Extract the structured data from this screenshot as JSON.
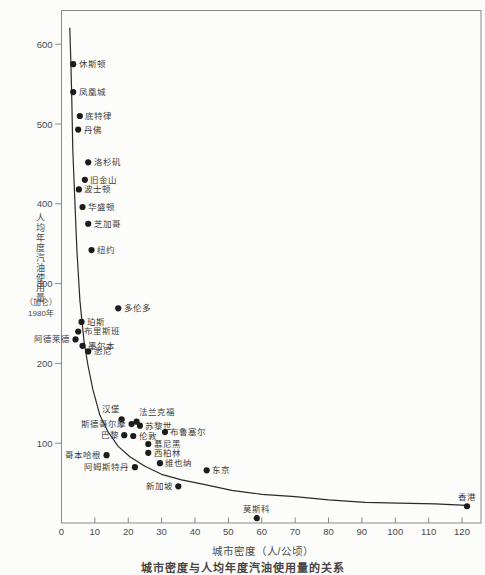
{
  "page": {
    "background": "#fcfcfa",
    "caption": "城市密度与人均年度汽油使用量的关系"
  },
  "chart_data": {
    "type": "scatter",
    "title": "",
    "xlabel": "城市密度（人/公顷）",
    "ylabel": "人均年度汽油使用量",
    "ylabel_unit": "（加仑）",
    "ylabel_year": "1980年",
    "xlim": [
      0,
      125
    ],
    "ylim": [
      0,
      640
    ],
    "x_ticks": [
      0,
      10,
      20,
      30,
      40,
      50,
      60,
      70,
      80,
      90,
      100,
      110,
      120
    ],
    "y_ticks": [
      100,
      200,
      300,
      400,
      500,
      600
    ],
    "grid": false,
    "legend": "none",
    "colors": {
      "dot": "#1c1c1c",
      "curve": "#2a2a2a",
      "frame": "#8a8a8a",
      "text": "#3d3d3d"
    },
    "points": [
      {
        "name": "休斯顿",
        "x": 3.5,
        "y": 575,
        "side": "right"
      },
      {
        "name": "凤凰城",
        "x": 3.5,
        "y": 540,
        "side": "right"
      },
      {
        "name": "底特律",
        "x": 5.5,
        "y": 510,
        "side": "right"
      },
      {
        "name": "丹佛",
        "x": 5,
        "y": 493,
        "side": "right"
      },
      {
        "name": "洛杉矶",
        "x": 8,
        "y": 452,
        "side": "right"
      },
      {
        "name": "旧金山",
        "x": 7,
        "y": 430,
        "side": "right"
      },
      {
        "name": "波士顿",
        "x": 5.2,
        "y": 418,
        "side": "right"
      },
      {
        "name": "华盛顿",
        "x": 6.3,
        "y": 396,
        "side": "right"
      },
      {
        "name": "芝加哥",
        "x": 8,
        "y": 375,
        "side": "right"
      },
      {
        "name": "纽约",
        "x": 9,
        "y": 342,
        "side": "right"
      },
      {
        "name": "多伦多",
        "x": 17,
        "y": 269,
        "side": "right"
      },
      {
        "name": "珀斯",
        "x": 6,
        "y": 252,
        "side": "right"
      },
      {
        "name": "布里斯班",
        "x": 5,
        "y": 240,
        "side": "right"
      },
      {
        "name": "阿德莱德",
        "x": 4.2,
        "y": 230,
        "side": "left"
      },
      {
        "name": "墨尔本",
        "x": 6.3,
        "y": 222,
        "side": "right"
      },
      {
        "name": "悉尼",
        "x": 8,
        "y": 215,
        "side": "right"
      },
      {
        "name": "汉堡",
        "x": 18,
        "y": 130,
        "side": "above-left"
      },
      {
        "name": "法兰克福",
        "x": 22.5,
        "y": 127,
        "side": "above-right"
      },
      {
        "name": "斯德哥尔摩",
        "x": 21,
        "y": 124,
        "side": "left"
      },
      {
        "name": "苏黎世",
        "x": 23.5,
        "y": 122,
        "side": "right"
      },
      {
        "name": "布鲁塞尔",
        "x": 31,
        "y": 114,
        "side": "right"
      },
      {
        "name": "巴黎",
        "x": 18.8,
        "y": 110,
        "side": "left"
      },
      {
        "name": "伦敦",
        "x": 21.5,
        "y": 109,
        "side": "right"
      },
      {
        "name": "慕尼黑",
        "x": 26,
        "y": 99,
        "side": "right"
      },
      {
        "name": "西柏林",
        "x": 26,
        "y": 88,
        "side": "right"
      },
      {
        "name": "哥本哈根",
        "x": 13.5,
        "y": 85,
        "side": "left"
      },
      {
        "name": "维也纳",
        "x": 29.5,
        "y": 75,
        "side": "right"
      },
      {
        "name": "阿姆斯特丹",
        "x": 22,
        "y": 70,
        "side": "left"
      },
      {
        "name": "东京",
        "x": 43.5,
        "y": 66,
        "side": "right"
      },
      {
        "name": "新加坡",
        "x": 35,
        "y": 46,
        "side": "left"
      },
      {
        "name": "莫斯科",
        "x": 58.5,
        "y": 6,
        "side": "above"
      },
      {
        "name": "香港",
        "x": 121.5,
        "y": 21,
        "side": "above"
      }
    ],
    "curve_points": [
      [
        2.5,
        620
      ],
      [
        2.8,
        580
      ],
      [
        3.1,
        530
      ],
      [
        3.4,
        467
      ],
      [
        4,
        405
      ],
      [
        4.6,
        342
      ],
      [
        5.5,
        279
      ],
      [
        6.7,
        229
      ],
      [
        7.9,
        198
      ],
      [
        9.4,
        167
      ],
      [
        11.5,
        135
      ],
      [
        14,
        114
      ],
      [
        17,
        96
      ],
      [
        20.5,
        83
      ],
      [
        25,
        71
      ],
      [
        30,
        61
      ],
      [
        36,
        54
      ],
      [
        43,
        48
      ],
      [
        51,
        41
      ],
      [
        60,
        36
      ],
      [
        70,
        33
      ],
      [
        80,
        29
      ],
      [
        91,
        26
      ],
      [
        101,
        25
      ],
      [
        112,
        24
      ],
      [
        121.5,
        22
      ]
    ]
  },
  "layout": {
    "plot_px": {
      "left": 61.5,
      "top": 10.5,
      "right": 481,
      "bottom": 523
    },
    "px_per_x": 3.3375,
    "px_per_y": 0.798
  }
}
